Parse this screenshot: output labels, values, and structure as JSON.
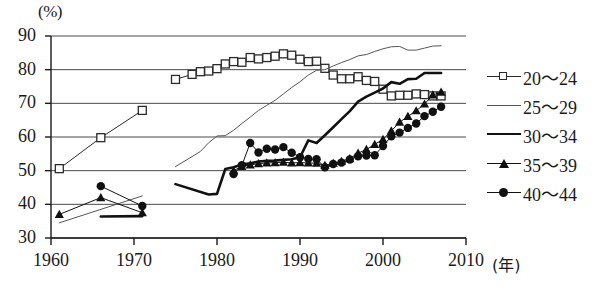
{
  "axes": {
    "y_unit": "(%)",
    "x_unit": "(年)",
    "y_ticks": [
      30,
      40,
      50,
      60,
      70,
      80,
      90
    ],
    "x_ticks": [
      1960,
      1970,
      1980,
      1990,
      2000,
      2010
    ]
  },
  "legend": {
    "items": [
      {
        "label": "20～24",
        "marker": "open-square",
        "line": "thin",
        "color": "#2b2b2b"
      },
      {
        "label": "25～29",
        "marker": "none",
        "line": "thin",
        "color": "#555555"
      },
      {
        "label": "30～34",
        "marker": "none",
        "line": "thick",
        "color": "#111111"
      },
      {
        "label": "35～39",
        "marker": "filled-triangle",
        "line": "thin",
        "color": "#111111"
      },
      {
        "label": "40～44",
        "marker": "filled-circle",
        "line": "thin",
        "color": "#111111"
      }
    ]
  },
  "chart_data": {
    "type": "line",
    "title": "",
    "subtitle": "",
    "xlabel": "(年)",
    "ylabel": "(%)",
    "xlim": [
      1960,
      2010
    ],
    "ylim": [
      30,
      90
    ],
    "grid": true,
    "legend_position": "right",
    "series": [
      {
        "name": "20～24",
        "marker": "open-square",
        "color": "#2b2b2b",
        "linewidth": 1,
        "points": [
          [
            1961,
            50.6
          ],
          [
            1966,
            59.8
          ],
          [
            1971,
            67.9
          ]
        ],
        "points2": [
          [
            1975,
            77.1
          ],
          [
            1977,
            78.6
          ],
          [
            1978,
            79.4
          ],
          [
            1979,
            79.6
          ],
          [
            1980,
            80.3
          ],
          [
            1981,
            81.7
          ],
          [
            1982,
            82.4
          ],
          [
            1983,
            82.2
          ],
          [
            1984,
            83.6
          ],
          [
            1985,
            83.2
          ],
          [
            1986,
            83.6
          ],
          [
            1987,
            84.0
          ],
          [
            1988,
            84.7
          ],
          [
            1989,
            84.3
          ],
          [
            1990,
            83.1
          ],
          [
            1991,
            82.4
          ],
          [
            1992,
            82.5
          ],
          [
            1993,
            80.4
          ],
          [
            1994,
            78.4
          ],
          [
            1995,
            77.3
          ],
          [
            1996,
            77.3
          ],
          [
            1997,
            77.9
          ],
          [
            1998,
            76.8
          ],
          [
            1999,
            76.5
          ],
          [
            2000,
            74.2
          ],
          [
            2001,
            72.2
          ],
          [
            2002,
            72.4
          ],
          [
            2003,
            72.4
          ],
          [
            2004,
            72.8
          ],
          [
            2005,
            72.6
          ],
          [
            2006,
            72.2
          ],
          [
            2007,
            72.2
          ]
        ]
      },
      {
        "name": "25～29",
        "marker": "none",
        "color": "#555555",
        "linewidth": 1,
        "points": [
          [
            1961,
            34.5
          ],
          [
            1971,
            42.5
          ]
        ],
        "points2": [
          [
            1975,
            51.2
          ],
          [
            1978,
            55.7
          ],
          [
            1979,
            58.3
          ],
          [
            1980,
            60.3
          ],
          [
            1981,
            60.4
          ],
          [
            1982,
            62.0
          ],
          [
            1983,
            64.0
          ],
          [
            1984,
            65.9
          ],
          [
            1985,
            67.9
          ],
          [
            1986,
            69.4
          ],
          [
            1987,
            70.9
          ],
          [
            1988,
            72.8
          ],
          [
            1989,
            74.7
          ],
          [
            1990,
            76.4
          ],
          [
            1991,
            78.4
          ],
          [
            1992,
            79.8
          ],
          [
            1993,
            80.0
          ],
          [
            1994,
            81.1
          ],
          [
            1995,
            82.1
          ],
          [
            1996,
            83.0
          ],
          [
            1997,
            84.1
          ],
          [
            1998,
            84.5
          ],
          [
            1999,
            85.4
          ],
          [
            2000,
            86.2
          ],
          [
            2001,
            86.8
          ],
          [
            2002,
            86.9
          ],
          [
            2003,
            85.8
          ],
          [
            2004,
            85.8
          ],
          [
            2005,
            86.4
          ],
          [
            2006,
            87.0
          ],
          [
            2007,
            87.1
          ]
        ]
      },
      {
        "name": "30～34",
        "marker": "none",
        "color": "#111111",
        "linewidth": 2.6,
        "points": [
          [
            1966,
            36.4
          ],
          [
            1971,
            36.5
          ]
        ],
        "points2": [
          [
            1975,
            46.0
          ],
          [
            1979,
            42.9
          ],
          [
            1980,
            43.1
          ],
          [
            1981,
            50.5
          ],
          [
            1982,
            51.0
          ],
          [
            1983,
            51.8
          ],
          [
            1984,
            52.2
          ],
          [
            1985,
            52.7
          ],
          [
            1986,
            52.9
          ],
          [
            1987,
            53.0
          ],
          [
            1988,
            53.2
          ],
          [
            1989,
            53.4
          ],
          [
            1990,
            54.0
          ],
          [
            1991,
            59.0
          ],
          [
            1992,
            58.2
          ],
          [
            1993,
            60.5
          ],
          [
            1994,
            62.9
          ],
          [
            1995,
            65.3
          ],
          [
            1996,
            67.7
          ],
          [
            1997,
            70.5
          ],
          [
            1998,
            72.0
          ],
          [
            1999,
            73.2
          ],
          [
            2000,
            74.4
          ],
          [
            2001,
            76.3
          ],
          [
            2002,
            75.8
          ],
          [
            2003,
            77.2
          ],
          [
            2004,
            77.3
          ],
          [
            2005,
            79.0
          ],
          [
            2006,
            79.0
          ],
          [
            2007,
            79.0
          ]
        ]
      },
      {
        "name": "35～39",
        "marker": "filled-triangle",
        "color": "#111111",
        "linewidth": 1,
        "points": [
          [
            1961,
            37.0
          ],
          [
            1966,
            42.0
          ],
          [
            1971,
            37.5
          ]
        ],
        "points2": [
          [
            1982,
            50.0
          ],
          [
            1983,
            51.3
          ],
          [
            1984,
            51.7
          ],
          [
            1985,
            52.1
          ],
          [
            1986,
            52.3
          ],
          [
            1987,
            52.4
          ],
          [
            1988,
            52.5
          ],
          [
            1989,
            52.3
          ],
          [
            1990,
            52.4
          ],
          [
            1991,
            52.3
          ],
          [
            1992,
            52.2
          ],
          [
            1993,
            51.6
          ],
          [
            1994,
            52.2
          ],
          [
            1995,
            52.8
          ],
          [
            1996,
            53.6
          ],
          [
            1997,
            55.2
          ],
          [
            1998,
            56.3
          ],
          [
            1999,
            57.8
          ],
          [
            2000,
            59.3
          ],
          [
            2001,
            61.8
          ],
          [
            2002,
            64.4
          ],
          [
            2003,
            66.1
          ],
          [
            2004,
            67.8
          ],
          [
            2005,
            69.8
          ],
          [
            2006,
            72.5
          ],
          [
            2007,
            73.3
          ]
        ]
      },
      {
        "name": "40～44",
        "marker": "filled-circle",
        "color": "#111111",
        "linewidth": 1,
        "points": [
          [
            1966,
            45.4
          ],
          [
            1971,
            39.5
          ]
        ],
        "points2": [
          [
            1982,
            49.0
          ],
          [
            1983,
            51.6
          ],
          [
            1984,
            58.2
          ],
          [
            1985,
            55.4
          ],
          [
            1986,
            56.5
          ],
          [
            1987,
            56.3
          ],
          [
            1988,
            57.0
          ],
          [
            1989,
            55.3
          ],
          [
            1990,
            54.0
          ],
          [
            1991,
            53.5
          ],
          [
            1992,
            53.4
          ],
          [
            1993,
            51.0
          ],
          [
            1994,
            52.0
          ],
          [
            1995,
            52.4
          ],
          [
            1996,
            53.3
          ],
          [
            1997,
            54.3
          ],
          [
            1998,
            54.5
          ],
          [
            1999,
            54.6
          ],
          [
            2000,
            57.3
          ],
          [
            2001,
            60.2
          ],
          [
            2002,
            61.3
          ],
          [
            2003,
            62.7
          ],
          [
            2004,
            64.0
          ],
          [
            2005,
            66.2
          ],
          [
            2006,
            67.5
          ],
          [
            2007,
            69.0
          ]
        ]
      }
    ]
  }
}
